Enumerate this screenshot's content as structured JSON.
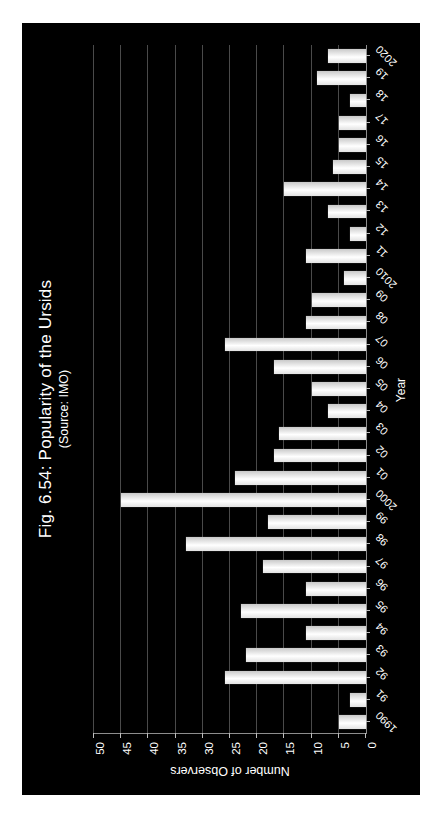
{
  "figure": {
    "background_color": "#000000",
    "page_background_color": "#ffffff",
    "orientation": "rotated-90"
  },
  "chart_data": {
    "type": "bar",
    "title": "Fig. 6.54: Popularity of the Ursids",
    "subtitle": "(Source: IMO)",
    "xlabel": "Year",
    "ylabel": "Number of Observers",
    "ylim": [
      0,
      50
    ],
    "ytick_labels": [
      "0",
      "5",
      "10",
      "15",
      "20",
      "25",
      "30",
      "35",
      "40",
      "45",
      "50"
    ],
    "ytick_values": [
      0,
      5,
      10,
      15,
      20,
      25,
      30,
      35,
      40,
      45,
      50
    ],
    "grid": true,
    "grid_axis": "y",
    "legend": null,
    "bar_color": "#ffffff",
    "orientation": "vertical-rotated",
    "categories": [
      "1990",
      "91",
      "92",
      "93",
      "94",
      "95",
      "96",
      "97",
      "98",
      "99",
      "2000",
      "01",
      "02",
      "03",
      "04",
      "05",
      "06",
      "07",
      "08",
      "09",
      "2010",
      "11",
      "12",
      "13",
      "14",
      "15",
      "16",
      "17",
      "18",
      "19",
      "2020"
    ],
    "values": [
      5,
      3,
      26,
      22,
      11,
      23,
      11,
      19,
      33,
      18,
      45,
      24,
      17,
      16,
      7,
      10,
      17,
      26,
      11,
      10,
      4,
      11,
      3,
      7,
      15,
      6,
      5,
      5,
      3,
      9,
      7
    ]
  }
}
